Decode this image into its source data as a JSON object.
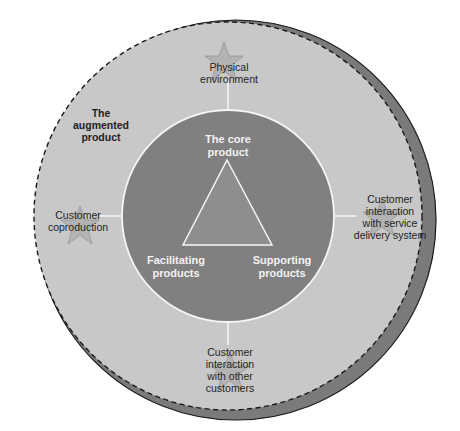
{
  "colors": {
    "background": "#ffffff",
    "outer_ring": "#c8c8c8",
    "shadow": "#7a7a7a",
    "inner_circle": "#808080",
    "triangle_fill": "#8e8e8e",
    "lines": "#f5f5f5",
    "dashed_border": "#1a1a1a",
    "star": "#b3b3b3",
    "star_stroke": "#8a8a8a"
  },
  "outer": {
    "title": [
      "The",
      "augmented",
      "product"
    ]
  },
  "core": {
    "top": [
      "The core",
      "product"
    ],
    "left": [
      "Facilitating",
      "products"
    ],
    "right": [
      "Supporting",
      "products"
    ]
  },
  "elements": [
    {
      "id": "physical-environment",
      "position": "top",
      "lines": [
        "Physical",
        "environment"
      ]
    },
    {
      "id": "customer-interaction-service-delivery",
      "position": "right",
      "lines": [
        "Customer",
        "interaction",
        "with service",
        "delivery system"
      ]
    },
    {
      "id": "customer-interaction-other-customers",
      "position": "bottom",
      "lines": [
        "Customer",
        "interaction",
        "with other",
        "customers"
      ]
    },
    {
      "id": "customer-coproduction",
      "position": "left",
      "lines": [
        "Customer",
        "coproduction"
      ]
    }
  ]
}
